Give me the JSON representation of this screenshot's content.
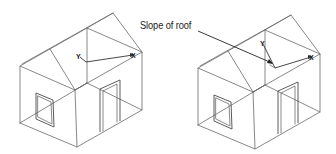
{
  "figure": {
    "callout": {
      "label": "Slope of roof"
    },
    "houses": [
      {
        "name": "house-left",
        "ucs": {
          "x_label": "X",
          "y_label": "Y",
          "aligned_to": "world"
        }
      },
      {
        "name": "house-right",
        "ucs": {
          "x_label": "X",
          "y_label": "Y",
          "aligned_to": "roof-slope"
        }
      }
    ],
    "colors": {
      "line": "#6a6a6a",
      "text": "#222222",
      "background": "#ffffff"
    }
  }
}
